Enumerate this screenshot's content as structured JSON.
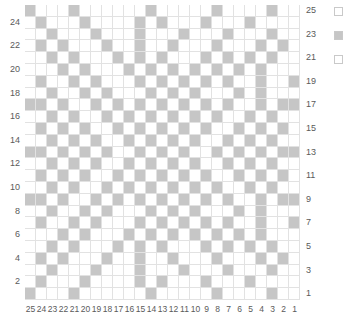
{
  "chart_data": {
    "type": "heatmap",
    "title": "",
    "xlabel": "",
    "ylabel": "",
    "columns": 25,
    "rows": 25,
    "colors": {
      "background_stitch": "#ffffff",
      "foreground_stitch": "#c6c6c6",
      "gridline": "#e2e2e2",
      "label_text": "#5a5a5a"
    },
    "legend_position": "right",
    "axis": {
      "left_ticks": [
        24,
        22,
        20,
        18,
        16,
        14,
        12,
        10,
        8,
        6,
        4,
        2
      ],
      "right_ticks": [
        25,
        23,
        21,
        19,
        17,
        15,
        13,
        11,
        9,
        7,
        5,
        3,
        1
      ],
      "bottom_ticks": [
        25,
        24,
        23,
        22,
        21,
        20,
        19,
        18,
        17,
        16,
        15,
        14,
        13,
        12,
        11,
        10,
        9,
        8,
        7,
        6,
        5,
        4,
        3,
        2,
        1
      ],
      "row_order": "bottom-to-top, row 1 at bottom",
      "column_order": "right-to-left, column 1 at right"
    },
    "cells": [
      "1000100000010000010000100",
      "0100010000101000100010000",
      "0010001000100010001000100",
      "0101000100100100010001010",
      "0010100010101000101010100",
      "0001010001010101010101000",
      "0100101000101010101001001",
      "0010010100010101000101000",
      "1101001010101010101001011",
      "0010100101010101010010100",
      "0101010010101010100101010",
      "0010101001010101001010100",
      "1101010100101010010101011",
      "0010101001010101001010100",
      "0101010010101010100101010",
      "0010100101010101010010100",
      "1101001010101010101001011",
      "0010010100010101000101000",
      "0100101000101010101001001",
      "0001010001010101010101000",
      "0010100010101000101010100",
      "0101000100100100010001010",
      "0010001000100010001000100",
      "0100010000101000100010000",
      "1000100000010000010000100"
    ],
    "cell_legend": {
      "0": "background_stitch",
      "1": "foreground_stitch"
    }
  },
  "legend": {
    "items": [
      {
        "label": "",
        "color": "#ffffff",
        "swatch": "empty-swatch"
      },
      {
        "label": "",
        "color": "#c6c6c6",
        "swatch": "filled-swatch"
      },
      {
        "label": "",
        "color": "#ffffff",
        "swatch": "empty-swatch"
      }
    ]
  }
}
